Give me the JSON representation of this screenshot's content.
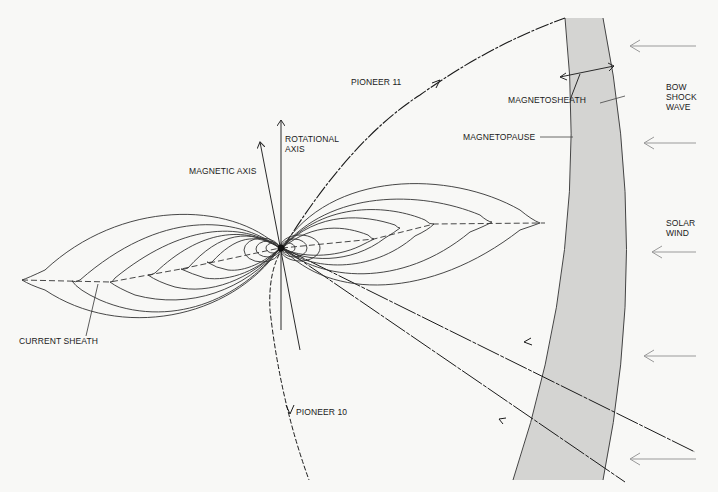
{
  "diagram": {
    "labels": {
      "pioneer11": "PIONEER 11",
      "pioneer10": "PIONEER 10",
      "rotational_axis": [
        "ROTATIONAL",
        "AXIS"
      ],
      "magnetic_axis": "MAGNETIC AXIS",
      "magnetosheath": "MAGNETOSHEATH",
      "magnetopause": "MAGNETOPAUSE",
      "bow_shock_wave": [
        "BOW",
        "SHOCK",
        "WAVE"
      ],
      "solar_wind": [
        "SOLAR",
        "WIND"
      ],
      "current_sheath": "CURRENT SHEATH"
    },
    "colors": {
      "background": "#f8f8f6",
      "magnetosheath_fill": "#d4d4d2",
      "line": "#2a2a2a",
      "solar_wind_arrow": "#9a9a9a"
    },
    "solar_wind_arrow_count": 6
  }
}
